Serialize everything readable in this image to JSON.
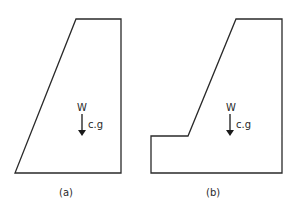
{
  "figures": [
    {
      "id": "a",
      "caption": "(a)",
      "force_label": "W",
      "point_label": "c.g",
      "shape": "trapezoid-dam-section"
    },
    {
      "id": "b",
      "caption": "(b)",
      "force_label": "W",
      "point_label": "c.g",
      "shape": "stepped-dam-section"
    }
  ],
  "colors": {
    "stroke": "#2a2a2a",
    "background": "#ffffff"
  }
}
